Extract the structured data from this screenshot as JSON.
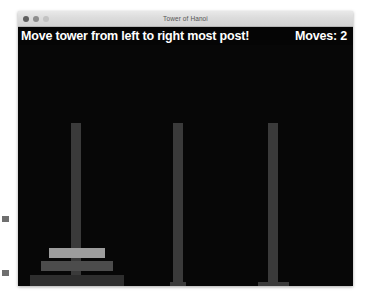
{
  "window": {
    "title": "Tower of Hanoi",
    "traffic_lights": [
      {
        "name": "close",
        "color": "#5f5f5f"
      },
      {
        "name": "minimize",
        "color": "#8d8d8d"
      },
      {
        "name": "zoom",
        "color": "#c2c2c2"
      }
    ]
  },
  "header": {
    "message": "Move tower from left to right most post!",
    "moves_label": "Moves: 2",
    "moves_count": 2,
    "background": "#050505",
    "text_color": "#ffffff"
  },
  "game": {
    "canvas_background": "#070707",
    "peg_color": "#3a3a3a",
    "pegs": [
      {
        "id": "left",
        "label": "left post",
        "disk_count": 3
      },
      {
        "id": "middle",
        "label": "middle post",
        "disk_count": 0
      },
      {
        "id": "right",
        "label": "right most post",
        "disk_count": 0
      }
    ],
    "disks": [
      {
        "id": "small",
        "size": 1,
        "peg": "left",
        "stack_position": 3,
        "color": "#9d9d9d"
      },
      {
        "id": "medium",
        "size": 2,
        "peg": "left",
        "stack_position": 2,
        "color": "#4c4c4c"
      },
      {
        "id": "large",
        "size": 3,
        "peg": "left",
        "stack_position": 1,
        "color": "#2e2e2e"
      }
    ]
  },
  "margin_marks": [
    {
      "id": "upper",
      "color": "#6f6f6f"
    },
    {
      "id": "lower",
      "color": "#6f6f6f"
    }
  ]
}
